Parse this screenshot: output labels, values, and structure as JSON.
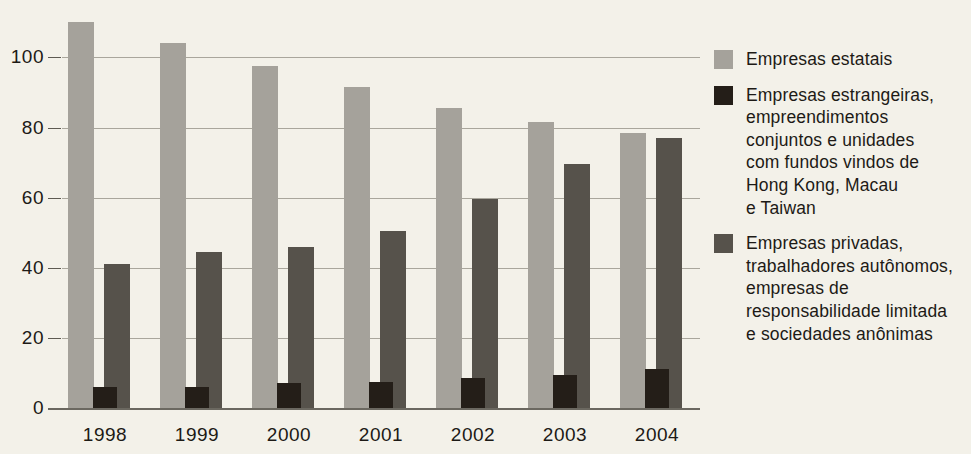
{
  "chart_data": {
    "type": "bar",
    "title": "",
    "subtitle": "",
    "xlabel": "",
    "ylabel": "",
    "categories": [
      "1998",
      "1999",
      "2000",
      "2001",
      "2002",
      "2003",
      "2004"
    ],
    "series": [
      {
        "name": "Empresas estatais",
        "color": "#a5a29b",
        "values": [
          110,
          104,
          97.5,
          91.5,
          85.5,
          81.5,
          78.5
        ]
      },
      {
        "name": "Empresas estrangeiras, empreendimentos conjuntos e unidades com fundos vindos de Hong Kong, Macau e Taiwan",
        "color": "#241e18",
        "values": [
          6,
          6,
          7,
          7.5,
          8.5,
          9.5,
          11
        ]
      },
      {
        "name": "Empresas privadas, trabalhadores autônomos, empresas de responsabilidade limitada e sociedades anônimas",
        "color": "#56524b",
        "values": [
          41,
          44.5,
          46,
          50.5,
          59.5,
          69.5,
          77
        ]
      }
    ],
    "yticks": [
      0,
      20,
      40,
      60,
      80,
      100
    ],
    "ytick_labels": [
      "0",
      "20",
      "40",
      "60",
      "80",
      "100"
    ],
    "ylim": [
      0,
      117
    ],
    "grid": true,
    "legend_position": "right"
  },
  "legend": {
    "items": [
      {
        "color": "#a5a29b",
        "swatch_name": "legend-swatch-estatais",
        "label": "Empresas estatais"
      },
      {
        "color": "#241e18",
        "swatch_name": "legend-swatch-estrangeiras",
        "label": "Empresas estrangeiras,\nempreendimentos\nconjuntos e unidades\ncom fundos vindos de\nHong Kong, Macau\ne Taiwan"
      },
      {
        "color": "#56524b",
        "swatch_name": "legend-swatch-privadas",
        "label": "Empresas privadas,\ntrabalhadores autônomos,\nempresas de\nresponsabilidade limitada\ne sociedades anônimas"
      }
    ]
  },
  "colors": {
    "background": "#f3f1e9",
    "gridline": "#a9a69c",
    "axis": "#6b6860",
    "text": "#1d1a16",
    "state": "#a5a29b",
    "foreign": "#241e18",
    "private": "#56524b"
  }
}
